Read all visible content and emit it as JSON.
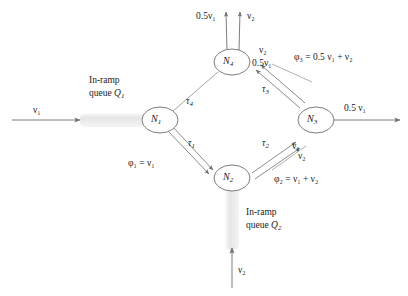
{
  "figure": {
    "type": "network-diagram",
    "background_color": "#ffffff",
    "line_color": "#6e6e6e",
    "text_color": "#1a1a1a",
    "queue_fill_color": "#e9e9e9"
  },
  "nodes": [
    {
      "id": "N1",
      "label": "N",
      "sub": "1",
      "cx": 160,
      "cy": 120,
      "rx": 18,
      "ry": 13
    },
    {
      "id": "N2",
      "label": "N",
      "sub": "2",
      "cx": 232,
      "cy": 178,
      "rx": 18,
      "ry": 13
    },
    {
      "id": "N3",
      "label": "N",
      "sub": "3",
      "cx": 316,
      "cy": 120,
      "rx": 18,
      "ry": 13
    },
    {
      "id": "N4",
      "label": "N",
      "sub": "4",
      "cx": 232,
      "cy": 62,
      "rx": 18,
      "ry": 13
    }
  ],
  "link_labels": {
    "tau1": {
      "base": "τ",
      "sub": "1"
    },
    "tau2": {
      "base": "τ",
      "sub": "2"
    },
    "tau3": {
      "base": "τ",
      "sub": "3"
    },
    "tau4": {
      "base": "τ",
      "sub": "4"
    }
  },
  "flow_labels": {
    "phi1": "φ₁ = ν₁",
    "phi2": "φ₂ = ν₁ + ν₂",
    "phi3": "φ₃ = 0.5 ν₁ + ν₂",
    "nu1_in": "ν₁",
    "nu2_in": "ν₂",
    "out_n3": "0.5 ν₁",
    "n4_out_left": "0.5ν₁",
    "n4_out_right": "ν₂",
    "n4_in_upper": "ν₂",
    "n4_in_lower": "0.5ν₁",
    "n3_in_upper": "ν₁",
    "n3_in_lower": "ν₂"
  },
  "ramps": [
    {
      "id": "Q1",
      "line1": "In-ramp",
      "line2_prefix": "queue ",
      "line2_symbol": "Q",
      "line2_sub": "1",
      "orientation": "horizontal",
      "x": 80,
      "y": 113,
      "w": 66,
      "h": 14
    },
    {
      "id": "Q2",
      "line1": "In-ramp",
      "line2_prefix": "queue ",
      "line2_symbol": "Q",
      "line2_sub": "2",
      "orientation": "vertical",
      "x": 225,
      "y": 186,
      "w": 14,
      "h": 64
    }
  ]
}
